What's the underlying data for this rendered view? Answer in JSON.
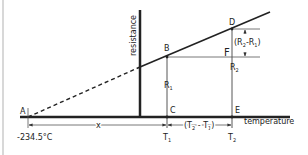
{
  "diagram": {
    "axes": {
      "y_label": "resistance",
      "x_label": "temperature"
    },
    "points": {
      "A": "A",
      "B": "B",
      "C": "C",
      "D": "D",
      "E": "E",
      "F": "F"
    },
    "segments": {
      "R1": "R",
      "R1_sub": "1",
      "R2": "R",
      "R2_sub": "2",
      "diff_R": "(R",
      "diff_R_sub2": "2",
      "diff_R_mid": "-R",
      "diff_R_sub1": "1",
      "diff_R_close": ")"
    },
    "dimensions": {
      "x": "x",
      "dT_open": "(T",
      "dT_sub2": "2",
      "dT_mid": " - T",
      "dT_sub1": "1",
      "dT_close": ")"
    },
    "ticks": {
      "T1": "T",
      "T1_sub": "1",
      "T2": "T",
      "T2_sub": "2",
      "absolute_zero": "-234.5°C"
    },
    "colors": {
      "line": "#222222",
      "thin": "#555555",
      "border": "#d8d8d8"
    }
  }
}
